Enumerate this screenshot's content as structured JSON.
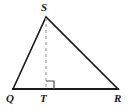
{
  "figure": {
    "kind": "geometry-diagram",
    "shape": "triangle",
    "background_color": "#ffffff",
    "stroke_color": "#1a1a1a",
    "altitude_color": "#a8a8a8",
    "right_angle_color": "#4d4d4d",
    "stroke_width": 1.6,
    "altitude_width": 1.3,
    "width": 131,
    "height": 110
  },
  "labels": {
    "apex": "S",
    "left_base": "Q",
    "foot": "T",
    "right_base": "R"
  },
  "points": {
    "S": {
      "x": 46,
      "y": 17
    },
    "Q": {
      "x": 13,
      "y": 89
    },
    "T": {
      "x": 46,
      "y": 89
    },
    "R": {
      "x": 118,
      "y": 89
    }
  },
  "segments": [
    {
      "name": "QS",
      "from": "Q",
      "to": "S",
      "style": "solid"
    },
    {
      "name": "SR",
      "from": "S",
      "to": "R",
      "style": "solid"
    },
    {
      "name": "QR",
      "from": "Q",
      "to": "R",
      "style": "solid"
    },
    {
      "name": "ST",
      "from": "S",
      "to": "T",
      "style": "dashed"
    }
  ],
  "markers": {
    "right_angle": {
      "at": "T",
      "size": 8,
      "opens_toward": "R"
    }
  },
  "dash_pattern": "3 3"
}
